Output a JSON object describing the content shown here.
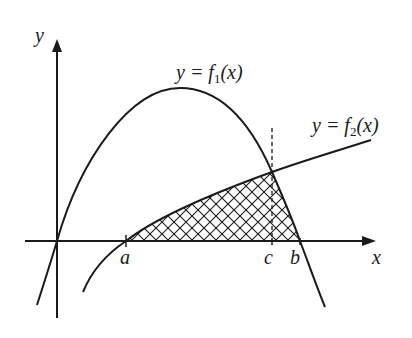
{
  "figure": {
    "axes": {
      "x_label": "x",
      "y_label": "y"
    },
    "curves": [
      {
        "id": "f1",
        "label_prefix": "y = f",
        "subscript": "1",
        "label_suffix": "(x)"
      },
      {
        "id": "f2",
        "label_prefix": "y = f",
        "subscript": "2",
        "label_suffix": "(x)"
      }
    ],
    "points": {
      "a": "a",
      "c": "c",
      "b": "b"
    },
    "shaded_region": "crosshatched region bounded by f2 from a to c, f1 from c to b, and the x-axis",
    "colors": {
      "stroke": "#1a1a1a",
      "background": "#ffffff"
    }
  }
}
